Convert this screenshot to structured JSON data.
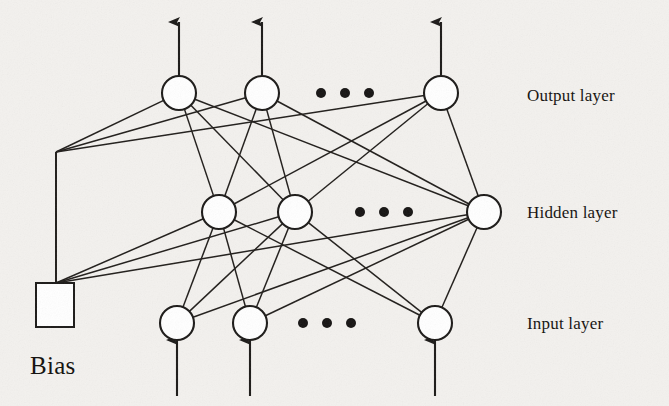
{
  "figure": {
    "kind": "neural-network-architecture-diagram",
    "background_color": "#f3f1ee",
    "ink_color": "#1b1917",
    "node_fill": "#ffffff",
    "width": 669,
    "height": 406
  },
  "labels": {
    "output_layer": "Output layer",
    "hidden_layer": "Hidden layer",
    "input_layer": "Input layer",
    "bias": "Bias"
  },
  "label_positions": {
    "output_layer": {
      "x": 527,
      "y": 86
    },
    "hidden_layer": {
      "x": 527,
      "y": 203
    },
    "input_layer": {
      "x": 527,
      "y": 314
    },
    "bias": {
      "x": 30,
      "y": 352
    }
  },
  "geometry": {
    "node_radius": 17,
    "layers": [
      {
        "name": "output",
        "y": 93,
        "nodes": [
          {
            "id": "o1",
            "x": 179,
            "y": 93
          },
          {
            "id": "o2",
            "x": 262,
            "y": 93
          },
          {
            "id": "o3",
            "x": 441,
            "y": 93
          }
        ],
        "ellipsis": {
          "y": 93,
          "xs": [
            321,
            345,
            369
          ],
          "r": 5
        },
        "arrows": {
          "direction": "up",
          "from_y": 76,
          "to_y": 22
        }
      },
      {
        "name": "hidden",
        "y": 212,
        "nodes": [
          {
            "id": "h1",
            "x": 219,
            "y": 212
          },
          {
            "id": "h2",
            "x": 295,
            "y": 212
          },
          {
            "id": "h3",
            "x": 484,
            "y": 212
          }
        ],
        "ellipsis": {
          "y": 212,
          "xs": [
            360,
            384,
            408
          ],
          "r": 5
        },
        "arrows": null
      },
      {
        "name": "input",
        "y": 323,
        "nodes": [
          {
            "id": "i1",
            "x": 177,
            "y": 323
          },
          {
            "id": "i2",
            "x": 250,
            "y": 323
          },
          {
            "id": "i3",
            "x": 435,
            "y": 323
          }
        ],
        "ellipsis": {
          "y": 323,
          "xs": [
            303,
            327,
            351
          ],
          "r": 5
        },
        "arrows": {
          "direction": "up",
          "from_y": 396,
          "to_y": 340
        }
      }
    ],
    "bias": {
      "box": {
        "x": 36,
        "y": 283,
        "w": 38,
        "h": 44
      },
      "stem_x": 56,
      "stem_top_y": 152,
      "stem_bottom_y": 283,
      "fanout_top_origin": {
        "x": 56,
        "y": 152
      },
      "fanout_bottom_origin": {
        "x": 56,
        "y": 283
      }
    },
    "edges": {
      "input_to_hidden": [
        [
          "i1",
          "h1"
        ],
        [
          "i1",
          "h2"
        ],
        [
          "i1",
          "h3"
        ],
        [
          "i2",
          "h1"
        ],
        [
          "i2",
          "h2"
        ],
        [
          "i2",
          "h3"
        ],
        [
          "i3",
          "h1"
        ],
        [
          "i3",
          "h2"
        ],
        [
          "i3",
          "h3"
        ]
      ],
      "hidden_to_output": [
        [
          "h1",
          "o1"
        ],
        [
          "h1",
          "o2"
        ],
        [
          "h1",
          "o3"
        ],
        [
          "h2",
          "o1"
        ],
        [
          "h2",
          "o2"
        ],
        [
          "h2",
          "o3"
        ],
        [
          "h3",
          "o1"
        ],
        [
          "h3",
          "o2"
        ],
        [
          "h3",
          "o3"
        ]
      ],
      "bias_to_output": [
        "o1",
        "o2",
        "o3"
      ],
      "bias_to_hidden": [
        "h1",
        "h2",
        "h3"
      ]
    }
  },
  "chart_data": {
    "type": "diagram",
    "layers": [
      {
        "name": "Input layer",
        "visible_nodes": 3,
        "truncated": true,
        "ellipsis": true,
        "has_external_inputs": true
      },
      {
        "name": "Hidden layer",
        "visible_nodes": 3,
        "truncated": true,
        "ellipsis": true,
        "has_external_inputs": false
      },
      {
        "name": "Output layer",
        "visible_nodes": 3,
        "truncated": true,
        "ellipsis": true,
        "has_external_outputs": true
      }
    ],
    "bias_unit": {
      "label": "Bias",
      "shape": "square",
      "connects_to": [
        "Hidden layer",
        "Output layer"
      ]
    },
    "connectivity": "fully connected between adjacent layers"
  }
}
